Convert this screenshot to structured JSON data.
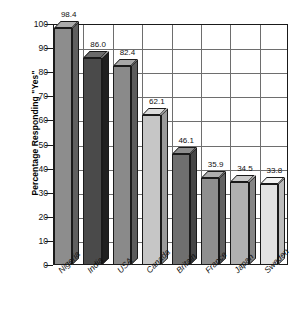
{
  "chart_data": {
    "type": "bar",
    "title": "",
    "subtitle": "",
    "xlabel": "",
    "ylabel": "Percentage Responding \"Yes\"",
    "ylim": [
      0,
      100
    ],
    "yticks": [
      0,
      10,
      20,
      30,
      40,
      50,
      60,
      70,
      80,
      90,
      100
    ],
    "ytick_labels": [
      "0",
      "10",
      "20",
      "30",
      "40",
      "50",
      "60",
      "70",
      "80",
      "90",
      "100"
    ],
    "grid": true,
    "legend": null,
    "style": "3d-bar",
    "categories": [
      "Nigeria",
      "India",
      "USA",
      "Canada",
      "Britain",
      "France",
      "Japan",
      "Sweden"
    ],
    "values": [
      98.4,
      86.0,
      82.4,
      62.1,
      46.1,
      35.9,
      34.5,
      33.8
    ],
    "value_labels": [
      "98.4",
      "86.0",
      "82.4",
      "62.1",
      "46.1",
      "35.9",
      "34.5",
      "33.8"
    ],
    "bar_colors": [
      "#8d8d8d",
      "#4a4a4a",
      "#8a8a8a",
      "#c6c6c6",
      "#6f6f6f",
      "#8f8f8f",
      "#b0b0b0",
      "#e2e2e2"
    ],
    "bar_side_colors": [
      "#5f5f5f",
      "#1f1f1f",
      "#5c5c5c",
      "#9a9a9a",
      "#464646",
      "#626262",
      "#858585",
      "#bdbdbd"
    ],
    "bar_top_colors": [
      "#ababab",
      "#6b6b6b",
      "#a8a8a8",
      "#dcdcdc",
      "#8d8d8d",
      "#adadad",
      "#cacaca",
      "#f2f2f2"
    ]
  },
  "axes": {
    "frame_color": "#1a1a1a",
    "grid_color": "#6e6e6e"
  }
}
